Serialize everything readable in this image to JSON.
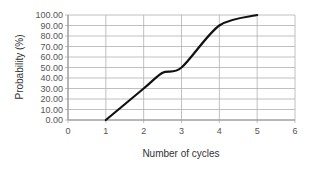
{
  "chart_data": {
    "type": "line",
    "title": "",
    "xlabel": "Number of cycles",
    "ylabel": "Probability (%)",
    "xlim": [
      0,
      6
    ],
    "ylim": [
      0,
      100
    ],
    "x_ticks": [
      "0",
      "1",
      "2",
      "3",
      "4",
      "5",
      "6"
    ],
    "y_ticks": [
      "0.00",
      "10.00",
      "20.00",
      "30.00",
      "40.00",
      "50.00",
      "60.00",
      "70.00",
      "80.00",
      "90.00",
      "100.00"
    ],
    "grid": true,
    "legend": "none",
    "series": [
      {
        "name": "Probability",
        "color": "#111111",
        "x": [
          1,
          2,
          2.5,
          3,
          4,
          5
        ],
        "y": [
          0,
          30,
          45,
          50,
          90,
          100
        ]
      }
    ]
  }
}
